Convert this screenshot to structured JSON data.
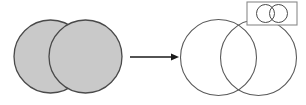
{
  "figure": {
    "type": "diagram",
    "canvas": {
      "width": 306,
      "height": 105,
      "background": "#ffffff"
    },
    "colors": {
      "filled_circle_fill": "#c9c9c9",
      "filled_circle_stroke": "#4a4a4a",
      "outlined_circle_fill": "#ffffff",
      "outlined_circle_stroke": "#5a5a5a",
      "arrow_color": "#1a1a1a",
      "inset_box_stroke": "#8a8a8a",
      "inset_box_fill": "#ffffff"
    },
    "left_group": {
      "label": "filled-overlapping-circles",
      "fill": "#c9c9c9",
      "stroke": "#4a4a4a",
      "stroke_width": 1.3,
      "circles": [
        {
          "name": "left-filled-circle",
          "cx": 50.5,
          "cy": 56.5,
          "r": 36.5
        },
        {
          "name": "right-filled-circle",
          "cx": 85.5,
          "cy": 56.5,
          "r": 36.5
        }
      ]
    },
    "arrow": {
      "label": "transformation-arrow",
      "color": "#1a1a1a",
      "line_width": 1.4,
      "x1": 130,
      "y1": 57,
      "x2": 171,
      "y2": 57,
      "head_length": 8,
      "head_width": 7
    },
    "right_group": {
      "label": "outlined-overlapping-circles",
      "fill": "#ffffff",
      "stroke": "#5a5a5a",
      "stroke_width": 1.1,
      "circles": [
        {
          "name": "left-outlined-circle",
          "cx": 218.5,
          "cy": 57.5,
          "r": 38.0
        },
        {
          "name": "right-outlined-circle",
          "cx": 258.5,
          "cy": 57.5,
          "r": 38.0
        }
      ]
    },
    "inset": {
      "label": "inset-thumbnail",
      "box": {
        "x": 247,
        "y": 2,
        "width": 50,
        "height": 23
      },
      "box_stroke": "#8a8a8a",
      "box_stroke_width": 1.1,
      "box_fill": "#ffffff",
      "circle_fill": "#ffffff",
      "circle_stroke": "#4a4a4a",
      "circle_stroke_width": 1.0,
      "circles": [
        {
          "name": "inset-left-circle",
          "cx": 265.5,
          "cy": 13.5,
          "r": 9.0
        },
        {
          "name": "inset-right-circle",
          "cx": 278.5,
          "cy": 13.5,
          "r": 9.0
        }
      ]
    }
  }
}
